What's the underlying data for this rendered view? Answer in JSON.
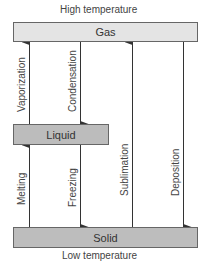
{
  "diagram": {
    "top_label": "High temperature",
    "bottom_label": "Low temperature",
    "states": {
      "gas": {
        "label": "Gas",
        "color": "#e4e4e4"
      },
      "liquid": {
        "label": "Liquid",
        "color": "#bcbcbc"
      },
      "solid": {
        "label": "Solid",
        "color": "#bdbdbd"
      }
    },
    "transitions": [
      {
        "label": "Vaporization",
        "from": "Liquid",
        "to": "Gas",
        "direction": "up"
      },
      {
        "label": "Condensation",
        "from": "Gas",
        "to": "Liquid",
        "direction": "down"
      },
      {
        "label": "Melting",
        "from": "Solid",
        "to": "Liquid",
        "direction": "up"
      },
      {
        "label": "Freezing",
        "from": "Liquid",
        "to": "Solid",
        "direction": "down"
      },
      {
        "label": "Sublimation",
        "from": "Solid",
        "to": "Gas",
        "direction": "up"
      },
      {
        "label": "Deposition",
        "from": "Gas",
        "to": "Solid",
        "direction": "down"
      }
    ]
  }
}
